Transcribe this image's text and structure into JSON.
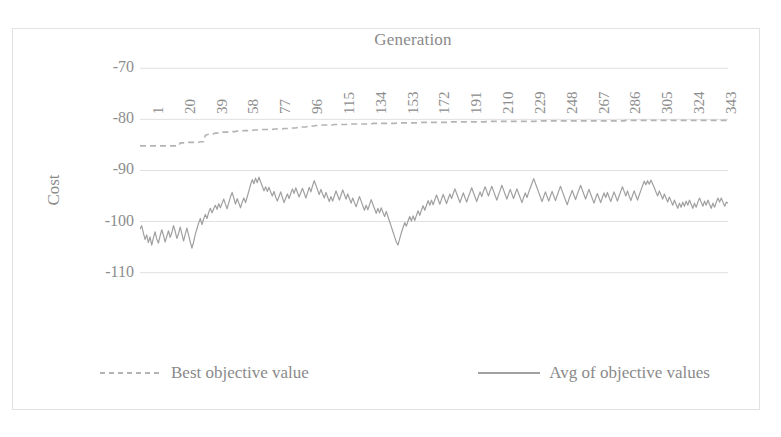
{
  "chart_data": {
    "type": "line",
    "title": "Generation",
    "xlabel": "Generation",
    "ylabel": "Cost",
    "xlim": [
      1,
      352
    ],
    "ylim": [
      -113,
      -68
    ],
    "yticks": [
      -70,
      -80,
      -90,
      -100,
      -110
    ],
    "ytick_labels": [
      "-70",
      "-80",
      "-90",
      "-100",
      "-110"
    ],
    "xticks": [
      1,
      20,
      39,
      58,
      77,
      96,
      115,
      134,
      153,
      172,
      191,
      210,
      229,
      248,
      267,
      286,
      305,
      324,
      343
    ],
    "xtick_labels": [
      "1",
      "20",
      "39",
      "58",
      "77",
      "96",
      "115",
      "134",
      "153",
      "172",
      "191",
      "210",
      "229",
      "248",
      "267",
      "286",
      "305",
      "324",
      "343"
    ],
    "grid": "horizontal",
    "legend_position": "bottom",
    "axis_color": "#d9d9d9",
    "grid_color": "#e0e0e0",
    "text_color": "#8a8a8a",
    "series": [
      {
        "name": "Best objective value",
        "style": "dashed",
        "color": "#b4b4b4",
        "values": [
          -85.2,
          -85.2,
          -85.2,
          -85.2,
          -85.2,
          -85.2,
          -85.2,
          -85.2,
          -85.2,
          -85.2,
          -85.2,
          -85.2,
          -85.2,
          -85.2,
          -85.2,
          -85.2,
          -85.2,
          -85.2,
          -85.2,
          -85.2,
          -85.2,
          -85.2,
          -85.2,
          -85.2,
          -84.6,
          -84.6,
          -84.6,
          -84.6,
          -84.6,
          -84.5,
          -84.5,
          -84.5,
          -84.5,
          -84.5,
          -84.5,
          -84.5,
          -84.4,
          -84.4,
          -84.4,
          -83.1,
          -83.0,
          -82.9,
          -82.9,
          -82.9,
          -82.8,
          -82.7,
          -82.7,
          -82.6,
          -82.6,
          -82.5,
          -82.5,
          -82.5,
          -82.5,
          -82.4,
          -82.4,
          -82.4,
          -82.4,
          -82.4,
          -82.3,
          -82.3,
          -82.3,
          -82.3,
          -82.2,
          -82.2,
          -82.2,
          -82.2,
          -82.2,
          -82.2,
          -82.1,
          -82.1,
          -82.1,
          -82.1,
          -82.1,
          -82.0,
          -82.0,
          -82.0,
          -82.0,
          -82.0,
          -82.0,
          -82.0,
          -81.9,
          -81.9,
          -81.9,
          -81.9,
          -81.9,
          -81.9,
          -81.8,
          -81.8,
          -81.8,
          -81.8,
          -81.8,
          -81.7,
          -81.7,
          -81.7,
          -81.6,
          -81.6,
          -81.6,
          -81.5,
          -81.5,
          -81.5,
          -81.4,
          -81.4,
          -81.3,
          -81.3,
          -81.3,
          -81.2,
          -81.2,
          -81.2,
          -81.2,
          -81.1,
          -81.1,
          -81.1,
          -81.1,
          -81.1,
          -81.1,
          -81.1,
          -81.0,
          -81.0,
          -81.0,
          -81.0,
          -81.0,
          -81.0,
          -81.0,
          -81.0,
          -81.0,
          -81.0,
          -80.9,
          -80.9,
          -80.9,
          -80.9,
          -80.9,
          -80.9,
          -80.9,
          -80.9,
          -80.9,
          -80.9,
          -80.9,
          -80.9,
          -80.9,
          -80.8,
          -80.8,
          -80.8,
          -80.8,
          -80.8,
          -80.8,
          -80.8,
          -80.8,
          -80.8,
          -80.8,
          -80.8,
          -80.8,
          -80.8,
          -80.8,
          -80.7,
          -80.7,
          -80.7,
          -80.7,
          -80.7,
          -80.7,
          -80.7,
          -80.7,
          -80.7,
          -80.7,
          -80.7,
          -80.7,
          -80.7,
          -80.7,
          -80.7,
          -80.6,
          -80.6,
          -80.6,
          -80.6,
          -80.6,
          -80.6,
          -80.6,
          -80.6,
          -80.6,
          -80.6,
          -80.6,
          -80.6,
          -80.6,
          -80.6,
          -80.6,
          -80.6,
          -80.6,
          -80.6,
          -80.5,
          -80.5,
          -80.5,
          -80.5,
          -80.5,
          -80.5,
          -80.5,
          -80.5,
          -80.5,
          -80.5,
          -80.5,
          -80.5,
          -80.5,
          -80.5,
          -80.5,
          -80.5,
          -80.5,
          -80.5,
          -80.5,
          -80.5,
          -80.5,
          -80.4,
          -80.4,
          -80.4,
          -80.4,
          -80.4,
          -80.4,
          -80.4,
          -80.4,
          -80.4,
          -80.4,
          -80.4,
          -80.4,
          -80.4,
          -80.4,
          -80.4,
          -80.4,
          -80.4,
          -80.4,
          -80.4,
          -80.4,
          -80.4,
          -80.4,
          -80.4,
          -80.4,
          -80.4,
          -80.4,
          -80.4,
          -80.4,
          -80.4,
          -80.4,
          -80.3,
          -80.3,
          -80.3,
          -80.3,
          -80.3,
          -80.3,
          -80.3,
          -80.3,
          -80.3,
          -80.3,
          -80.3,
          -80.3,
          -80.3,
          -80.3,
          -80.3,
          -80.3,
          -80.3,
          -80.3,
          -80.3,
          -80.3,
          -80.3,
          -80.3,
          -80.3,
          -80.3,
          -80.3,
          -80.3,
          -80.3,
          -80.3,
          -80.3,
          -80.3,
          -80.3,
          -80.3,
          -80.3,
          -80.3,
          -80.3,
          -80.3,
          -80.3,
          -80.3,
          -80.3,
          -80.3,
          -80.3,
          -80.3,
          -80.3,
          -80.3,
          -80.3,
          -80.3,
          -80.3,
          -80.3,
          -80.3,
          -80.3,
          -80.3,
          -80.3,
          -80.3,
          -80.2,
          -80.2,
          -80.2,
          -80.2,
          -80.2,
          -80.2,
          -80.2,
          -80.2,
          -80.2,
          -80.2,
          -80.2,
          -80.2,
          -80.2,
          -80.2,
          -80.2,
          -80.2,
          -80.2,
          -80.2,
          -80.2,
          -80.2,
          -80.2,
          -80.2,
          -80.2,
          -80.2,
          -80.2,
          -80.2,
          -80.2,
          -80.2,
          -80.2,
          -80.2,
          -80.2,
          -80.2,
          -80.2,
          -80.2,
          -80.2,
          -80.2,
          -80.2,
          -80.2,
          -80.2,
          -80.2,
          -80.2,
          -80.2,
          -80.2,
          -80.2,
          -80.2,
          -80.2,
          -80.2,
          -80.2,
          -80.2,
          -80.2,
          -80.2,
          -80.2,
          -80.2,
          -80.2,
          -80.2,
          -80.2,
          -80.2,
          -80.2,
          -80.2,
          -80.2,
          -80.2,
          -80.2
        ]
      },
      {
        "name": "Avg of objective values",
        "style": "solid",
        "color": "#a0a0a0",
        "values": [
          -101.5,
          -100.8,
          -102.2,
          -103.5,
          -102.6,
          -104.1,
          -103.0,
          -104.6,
          -103.2,
          -102.0,
          -103.4,
          -104.2,
          -102.8,
          -101.6,
          -102.7,
          -104.0,
          -102.9,
          -101.8,
          -103.1,
          -102.2,
          -100.8,
          -101.9,
          -103.3,
          -102.4,
          -101.1,
          -102.4,
          -103.8,
          -102.5,
          -101.3,
          -102.6,
          -104.0,
          -105.2,
          -104.0,
          -102.5,
          -101.4,
          -100.3,
          -99.4,
          -100.6,
          -99.5,
          -98.6,
          -99.4,
          -98.2,
          -97.4,
          -98.3,
          -97.5,
          -96.8,
          -97.6,
          -96.5,
          -97.3,
          -96.4,
          -95.6,
          -96.6,
          -97.5,
          -96.3,
          -95.2,
          -94.3,
          -95.4,
          -96.6,
          -95.5,
          -96.4,
          -97.3,
          -96.2,
          -95.4,
          -96.3,
          -95.2,
          -94.0,
          -92.8,
          -91.8,
          -92.6,
          -91.5,
          -92.4,
          -91.3,
          -92.2,
          -93.1,
          -94.0,
          -93.2,
          -94.1,
          -93.3,
          -94.2,
          -95.0,
          -94.1,
          -95.2,
          -96.0,
          -95.1,
          -94.2,
          -95.3,
          -96.3,
          -95.4,
          -94.6,
          -95.5,
          -94.5,
          -93.6,
          -94.5,
          -93.4,
          -94.3,
          -95.2,
          -94.3,
          -93.5,
          -94.4,
          -95.4,
          -94.4,
          -93.3,
          -94.2,
          -93.0,
          -92.0,
          -92.9,
          -93.8,
          -94.7,
          -93.7,
          -94.6,
          -95.4,
          -94.3,
          -95.2,
          -96.1,
          -95.1,
          -96.0,
          -95.0,
          -94.0,
          -94.9,
          -95.8,
          -94.8,
          -93.8,
          -94.7,
          -95.6,
          -94.6,
          -95.5,
          -96.4,
          -95.4,
          -96.3,
          -97.1,
          -96.1,
          -95.1,
          -96.0,
          -96.9,
          -97.8,
          -96.8,
          -97.7,
          -96.7,
          -95.7,
          -96.6,
          -97.5,
          -98.4,
          -97.4,
          -98.3,
          -97.3,
          -98.2,
          -99.0,
          -98.0,
          -99.0,
          -100.0,
          -101.0,
          -102.0,
          -103.0,
          -104.0,
          -104.6,
          -103.4,
          -102.2,
          -101.2,
          -100.2,
          -100.9,
          -99.9,
          -99.0,
          -99.9,
          -98.9,
          -99.8,
          -98.8,
          -97.9,
          -98.8,
          -97.8,
          -96.9,
          -97.8,
          -96.8,
          -95.9,
          -96.8,
          -95.8,
          -96.7,
          -95.7,
          -94.8,
          -95.7,
          -96.6,
          -95.6,
          -94.7,
          -95.6,
          -96.5,
          -95.5,
          -94.6,
          -95.5,
          -94.5,
          -93.6,
          -94.5,
          -95.4,
          -96.3,
          -95.3,
          -94.4,
          -95.3,
          -96.2,
          -95.2,
          -94.3,
          -93.4,
          -94.3,
          -95.2,
          -96.1,
          -95.1,
          -94.2,
          -95.1,
          -94.1,
          -93.2,
          -94.1,
          -95.0,
          -94.0,
          -93.1,
          -94.0,
          -94.9,
          -95.8,
          -94.8,
          -93.9,
          -92.9,
          -93.8,
          -94.7,
          -95.6,
          -94.6,
          -93.7,
          -94.6,
          -95.5,
          -94.5,
          -93.6,
          -94.5,
          -95.4,
          -96.3,
          -95.3,
          -94.4,
          -95.3,
          -94.3,
          -93.4,
          -92.5,
          -91.6,
          -92.5,
          -93.4,
          -94.3,
          -95.2,
          -96.1,
          -95.1,
          -94.2,
          -95.1,
          -96.0,
          -95.0,
          -94.1,
          -95.0,
          -95.9,
          -94.9,
          -94.0,
          -93.1,
          -94.0,
          -94.9,
          -95.8,
          -96.7,
          -95.7,
          -94.8,
          -93.9,
          -94.8,
          -95.7,
          -94.7,
          -93.8,
          -92.9,
          -93.8,
          -94.7,
          -95.6,
          -94.6,
          -93.7,
          -94.6,
          -95.5,
          -96.4,
          -95.4,
          -94.5,
          -95.4,
          -96.3,
          -95.3,
          -94.4,
          -95.3,
          -94.3,
          -95.2,
          -96.1,
          -95.1,
          -94.2,
          -95.1,
          -96.0,
          -95.0,
          -94.1,
          -93.2,
          -94.1,
          -95.0,
          -94.0,
          -95.0,
          -95.9,
          -94.9,
          -94.0,
          -94.9,
          -95.8,
          -94.8,
          -93.9,
          -93.0,
          -92.1,
          -92.8,
          -92.0,
          -92.7,
          -91.9,
          -92.6,
          -93.4,
          -94.2,
          -95.0,
          -94.0,
          -94.8,
          -95.6,
          -94.6,
          -95.4,
          -96.2,
          -95.2,
          -96.0,
          -96.8,
          -95.8,
          -96.6,
          -97.4,
          -96.4,
          -97.2,
          -96.2,
          -97.0,
          -96.0,
          -96.8,
          -95.8,
          -96.6,
          -97.4,
          -96.4,
          -97.2,
          -96.2,
          -95.4,
          -96.2,
          -97.0,
          -96.0,
          -96.8,
          -95.8,
          -96.6,
          -97.4,
          -96.4,
          -97.2,
          -96.2,
          -95.4,
          -96.2,
          -95.4,
          -96.2,
          -97.0,
          -96.2,
          -96.4
        ]
      }
    ]
  },
  "legend": {
    "entries": [
      {
        "label": "Best objective value",
        "style": "dashed",
        "color": "#b4b4b4"
      },
      {
        "label": "Avg of objective values",
        "style": "solid",
        "color": "#a0a0a0"
      }
    ]
  }
}
